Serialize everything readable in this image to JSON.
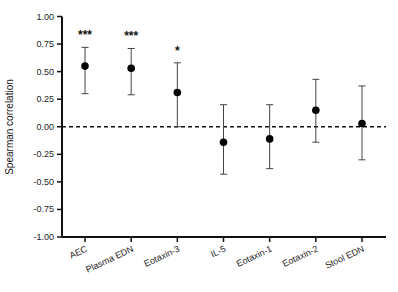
{
  "chart_data": {
    "type": "scatter",
    "subtype": "point-with-error-bars",
    "title": "",
    "xlabel": "",
    "ylabel": "Spearman correlation",
    "ylim": [
      -1.0,
      1.0
    ],
    "yticks": [
      "1.00",
      "0.75",
      "0.50",
      "0.25",
      "0.00",
      "-0.25",
      "-0.50",
      "-0.75",
      "-1.00"
    ],
    "ytick_values": [
      1.0,
      0.75,
      0.5,
      0.25,
      0.0,
      -0.25,
      -0.5,
      -0.75,
      -1.0
    ],
    "categories": [
      "AEC",
      "Plasma EDN",
      "Eotaxin-3",
      "IL-5",
      "Eotaxin-1",
      "Eotaxin-2",
      "Stool EDN"
    ],
    "values": [
      0.55,
      0.53,
      0.31,
      -0.14,
      -0.11,
      0.15,
      0.03
    ],
    "ci_upper": [
      0.72,
      0.71,
      0.58,
      0.2,
      0.2,
      0.43,
      0.37
    ],
    "ci_lower": [
      0.3,
      0.29,
      0.0,
      -0.43,
      -0.38,
      -0.14,
      -0.3
    ],
    "significance": [
      "***",
      "***",
      "*",
      "",
      "",
      "",
      ""
    ],
    "reference_line": {
      "y": 0.0,
      "style": "dashed"
    },
    "grid": false,
    "legend": null
  }
}
